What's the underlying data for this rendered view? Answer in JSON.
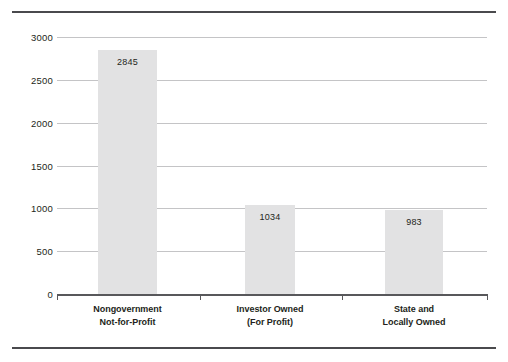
{
  "chart_data": {
    "type": "bar",
    "title": "",
    "subtitle": "",
    "xlabel": "",
    "ylabel": "",
    "categories": [
      "Nongovernment Not-for-Profit",
      "Investor Owned (For Profit)",
      "State and Locally Owned"
    ],
    "category_lines": [
      [
        "Nongovernment",
        "Not-for-Profit"
      ],
      [
        "Investor Owned",
        "(For Profit)"
      ],
      [
        "State and",
        "Locally Owned"
      ]
    ],
    "values": [
      2845,
      1034,
      983
    ],
    "value_labels": [
      "2845",
      "1034",
      "983"
    ],
    "ylim": [
      0,
      3000
    ],
    "ytick_values": [
      3000,
      2500,
      2000,
      1500,
      1000,
      500,
      0
    ],
    "ytick_labels": [
      "3000",
      "2500",
      "2000",
      "1500",
      "1000",
      "500",
      "0"
    ],
    "grid": true,
    "legend": null,
    "legend_position": "none",
    "colors": {
      "bar_fill": "#e2e2e3",
      "gridline": "#c4c4c6",
      "axis_line": "#58585b",
      "rule": "#4a4a4d",
      "text": "#231f20",
      "background": "#ffffff"
    }
  }
}
